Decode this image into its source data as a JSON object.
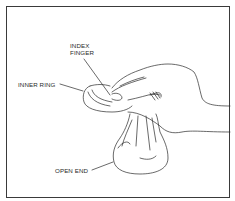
{
  "figure": {
    "labels": {
      "index_finger_line1": "INDEX",
      "index_finger_line2": "FINGER",
      "inner_ring": "INNER RING",
      "open_end": "OPEN END"
    },
    "colors": {
      "line": "#2a2a2a",
      "background": "#ffffff",
      "frame": "#3a3a3a"
    }
  }
}
